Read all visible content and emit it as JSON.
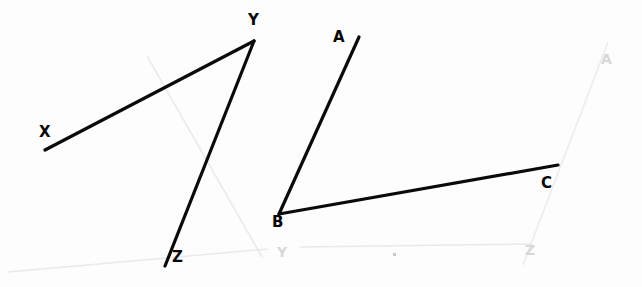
{
  "figure": {
    "width": 642,
    "height": 287,
    "background_color": "#fdfdfd",
    "stroke_color": "#0a0a0a",
    "stroke_width": 3.2,
    "ghost_color": "#e6e6e6",
    "ghost_width": 1.4
  },
  "angles": [
    {
      "name": "angle-xyz",
      "vertex": "Y",
      "rays": [
        "YX",
        "YZ"
      ],
      "points": {
        "X": {
          "label": "X",
          "x": 45,
          "y": 150,
          "label_x": 39,
          "label_y": 125
        },
        "Y": {
          "label": "Y",
          "x": 254,
          "y": 41,
          "label_x": 248,
          "label_y": 13
        },
        "Z": {
          "label": "Z",
          "x": 165,
          "y": 266,
          "label_x": 172,
          "label_y": 250
        }
      }
    },
    {
      "name": "angle-abc",
      "vertex": "B",
      "rays": [
        "BA",
        "BC"
      ],
      "points": {
        "A": {
          "label": "A",
          "x": 359,
          "y": 37,
          "label_x": 333,
          "label_y": 30
        },
        "B": {
          "label": "B",
          "x": 279,
          "y": 214,
          "label_x": 272,
          "label_y": 215
        },
        "C": {
          "label": "C",
          "x": 558,
          "y": 165,
          "label_x": 541,
          "label_y": 176
        }
      }
    }
  ],
  "ghost_marks": {
    "lines": [
      {
        "name": "ghost-diagonal-left",
        "x1": 147,
        "y1": 56,
        "x2": 262,
        "y2": 257
      },
      {
        "name": "ghost-diagonal-right",
        "x1": 608,
        "y1": 42,
        "x2": 523,
        "y2": 265
      },
      {
        "name": "ghost-baseline-left",
        "x1": 8,
        "y1": 272,
        "x2": 268,
        "y2": 249
      },
      {
        "name": "ghost-baseline-right",
        "x1": 300,
        "y1": 247,
        "x2": 532,
        "y2": 244
      }
    ],
    "labels": [
      {
        "name": "ghost-letter-a",
        "text": "A",
        "x": 601,
        "y": 52
      },
      {
        "name": "ghost-letter-y",
        "text": "Y",
        "x": 277,
        "y": 245
      },
      {
        "name": "ghost-letter-z",
        "text": "Z",
        "x": 525,
        "y": 243
      }
    ],
    "specks": [
      {
        "name": "paper-speck-1",
        "x": 393,
        "y": 253,
        "w": 3,
        "h": 3
      }
    ]
  }
}
